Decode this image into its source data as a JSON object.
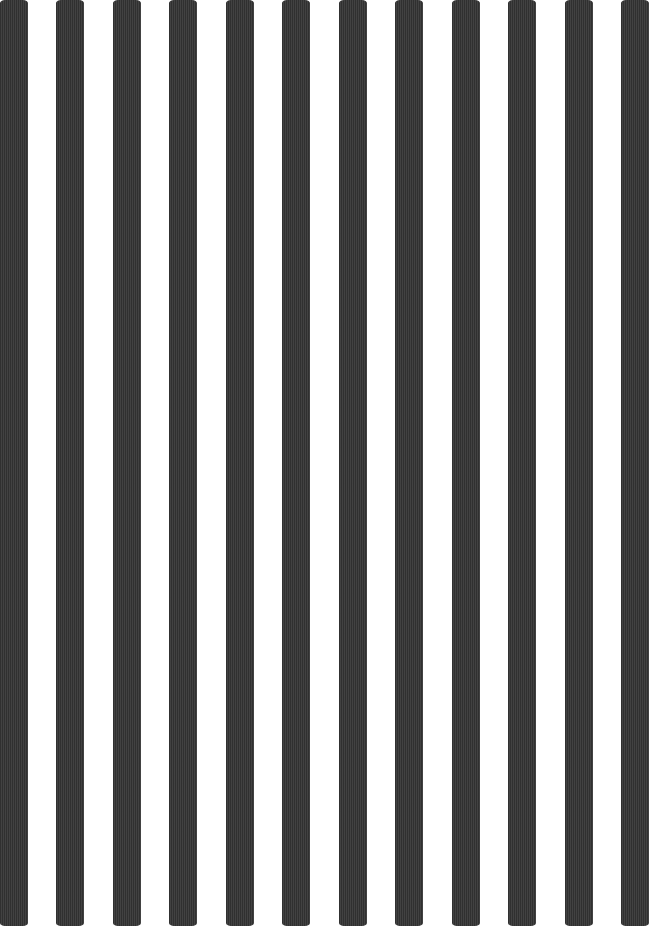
{
  "pattern": {
    "description": "Vertical black-and-white striped textured paper",
    "stripe_color": "#3a3a3a",
    "background_color": "#ffffff",
    "stripe_count": 12,
    "texture": "fine vertical ribbing"
  }
}
